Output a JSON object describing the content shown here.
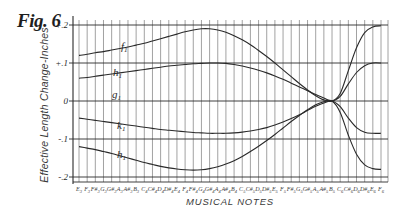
{
  "figure": {
    "title": "Fig. 6",
    "ylabel": "Effective Length Change-Inches",
    "xlabel": "MUSICAL NOTES"
  },
  "chart_data": {
    "type": "line",
    "title": "Fig. 6",
    "xlabel": "MUSICAL NOTES",
    "ylabel": "Effective Length Change-Inches",
    "ylim": [
      -0.2,
      0.2
    ],
    "yticks": [
      "+.2",
      "+.1",
      "0",
      "-.1",
      "-.2"
    ],
    "ytick_values": [
      0.2,
      0.1,
      0,
      -0.1,
      -0.2
    ],
    "grid": true,
    "legend": "inline curve labels",
    "categories": [
      "E3",
      "F3",
      "F#3",
      "G3",
      "G#3",
      "A3",
      "A#3",
      "B3",
      "C4",
      "C#4",
      "D4",
      "D#4",
      "E4",
      "F4",
      "F#4",
      "G4",
      "G#4",
      "A4",
      "A#4",
      "B4",
      "C5",
      "C#5",
      "D5",
      "D#5",
      "E5",
      "F5",
      "F#5",
      "G5",
      "G#5",
      "A5",
      "A#5",
      "B5",
      "C6",
      "C#6",
      "D6",
      "D#6",
      "E6",
      "F6"
    ],
    "series": [
      {
        "name": "f",
        "values": [
          0.12,
          0.123,
          0.127,
          0.13,
          0.134,
          0.138,
          0.142,
          0.147,
          0.152,
          0.158,
          0.164,
          0.17,
          0.176,
          0.182,
          0.187,
          0.19,
          0.19,
          0.187,
          0.181,
          0.172,
          0.161,
          0.148,
          0.133,
          0.117,
          0.1,
          0.082,
          0.064,
          0.046,
          0.029,
          0.014,
          0.003,
          0.0,
          0.02,
          0.08,
          0.14,
          0.18,
          0.195,
          0.198
        ]
      },
      {
        "name": "h",
        "values": [
          0.06,
          0.062,
          0.065,
          0.068,
          0.071,
          0.074,
          0.077,
          0.08,
          0.083,
          0.086,
          0.089,
          0.092,
          0.094,
          0.096,
          0.098,
          0.099,
          0.1,
          0.1,
          0.099,
          0.096,
          0.092,
          0.087,
          0.081,
          0.074,
          0.066,
          0.057,
          0.047,
          0.037,
          0.027,
          0.017,
          0.008,
          0.0,
          0.012,
          0.045,
          0.075,
          0.093,
          0.1,
          0.1
        ]
      },
      {
        "name": "g",
        "values": [
          0,
          0,
          0,
          0,
          0,
          0,
          0,
          0,
          0,
          0,
          0,
          0,
          0,
          0,
          0,
          0,
          0,
          0,
          0,
          0,
          0,
          0,
          0,
          0,
          0,
          0,
          0,
          0,
          0,
          0,
          0,
          0,
          0,
          0,
          0,
          0,
          0,
          0
        ]
      },
      {
        "name": "k",
        "values": [
          -0.045,
          -0.048,
          -0.051,
          -0.054,
          -0.057,
          -0.06,
          -0.063,
          -0.066,
          -0.069,
          -0.072,
          -0.075,
          -0.077,
          -0.079,
          -0.081,
          -0.083,
          -0.084,
          -0.085,
          -0.085,
          -0.085,
          -0.084,
          -0.082,
          -0.079,
          -0.075,
          -0.07,
          -0.063,
          -0.055,
          -0.046,
          -0.036,
          -0.025,
          -0.014,
          -0.005,
          0.0,
          -0.015,
          -0.045,
          -0.07,
          -0.082,
          -0.085,
          -0.085
        ]
      },
      {
        "name": "h",
        "values": [
          -0.12,
          -0.124,
          -0.128,
          -0.133,
          -0.138,
          -0.144,
          -0.15,
          -0.156,
          -0.162,
          -0.167,
          -0.172,
          -0.176,
          -0.179,
          -0.181,
          -0.182,
          -0.181,
          -0.178,
          -0.173,
          -0.166,
          -0.157,
          -0.146,
          -0.133,
          -0.119,
          -0.104,
          -0.088,
          -0.071,
          -0.054,
          -0.038,
          -0.023,
          -0.01,
          -0.002,
          0.0,
          -0.03,
          -0.09,
          -0.14,
          -0.168,
          -0.178,
          -0.18
        ]
      }
    ],
    "convergence_point": {
      "note": "B5",
      "value": 0.0
    }
  },
  "colors": {
    "ink": "#2a2a2a",
    "grid": "#8a8a8a",
    "background": "#ffffff"
  }
}
